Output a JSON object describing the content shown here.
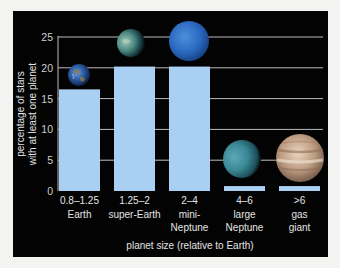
{
  "chart_data": {
    "type": "bar",
    "title": "",
    "xlabel": "planet size (relative to Earth)",
    "ylabel": [
      "percentage of stars",
      "with at least one planet"
    ],
    "ylim": [
      0,
      25
    ],
    "yticks": [
      0,
      5,
      10,
      15,
      20,
      25
    ],
    "grid": true,
    "categories": [
      {
        "range": "0.8–1.25",
        "name": [
          "Earth"
        ]
      },
      {
        "range": "1.25–2",
        "name": [
          "super-Earth"
        ]
      },
      {
        "range": "2–4",
        "name": [
          "mini-",
          "Neptune"
        ]
      },
      {
        "range": "4–6",
        "name": [
          "large",
          "Neptune"
        ]
      },
      {
        "range": ">6",
        "name": [
          "gas",
          "giant"
        ]
      }
    ],
    "values": [
      16.5,
      20.2,
      20.2,
      0.8,
      0.8
    ],
    "bar_color": "#a9cff2",
    "background": "#030303",
    "annotations": [
      "earth-image",
      "super-earth-image",
      "mini-neptune-image",
      "large-neptune-image",
      "gas-giant-image"
    ]
  }
}
